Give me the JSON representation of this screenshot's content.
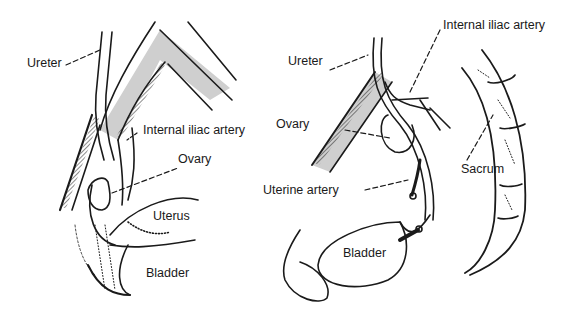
{
  "figure": {
    "panels": [
      {
        "id": "left",
        "labels": {
          "ureter": "Ureter",
          "internal_iliac_artery": "Internal iliac artery",
          "ovary": "Ovary",
          "uterus": "Uterus",
          "bladder": "Bladder"
        }
      },
      {
        "id": "right",
        "labels": {
          "ureter": "Ureter",
          "internal_iliac_artery": "Internal iliac artery",
          "ovary": "Ovary",
          "uterine_artery": "Uterine artery",
          "sacrum": "Sacrum",
          "bladder": "Bladder"
        }
      }
    ],
    "colors": {
      "ink": "#1a1a1a",
      "shade": "#c8c8c8",
      "background": "#ffffff"
    }
  }
}
